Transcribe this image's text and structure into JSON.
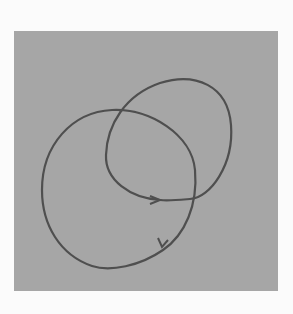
{
  "figure": {
    "background_color": "#fbfbfb",
    "panel_color": "#a6a6a6",
    "stroke_color": "#4f4f4f",
    "curves": [
      {
        "name": "upper-right-loop",
        "direction": "clockwise",
        "arrow_at": [
          157,
          200
        ]
      },
      {
        "name": "lower-left-loop",
        "direction": "clockwise",
        "arrow_at": [
          163,
          245
        ]
      }
    ]
  }
}
